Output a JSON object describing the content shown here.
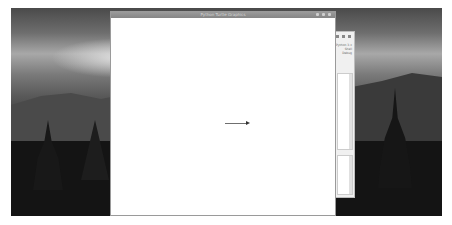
{
  "desktop": {
    "wallpaper": "silhouetted temples and mountains at sunset, grayscale"
  },
  "main_window": {
    "title": "Python Turtle Graphics",
    "controls": [
      "minimize",
      "maximize",
      "close"
    ],
    "canvas": {
      "background": "#ffffff",
      "turtle": {
        "shape": "arrow",
        "heading": "east",
        "line_color": "#6f6f6f"
      }
    }
  },
  "background_window": {
    "controls": [
      "minimize",
      "maximize",
      "close"
    ],
    "text_lines": [
      "Python 3.x",
      "Shell",
      "Debug"
    ]
  },
  "colors": {
    "titlebar": "#8f8f8f",
    "window_bg": "#ffffff",
    "desktop_dark": "#141414"
  }
}
